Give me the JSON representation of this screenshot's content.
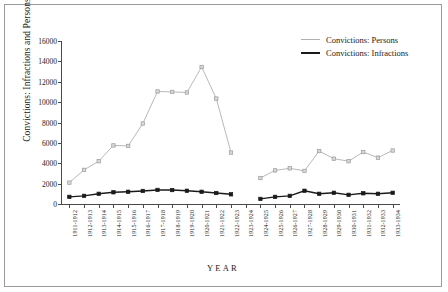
{
  "chart_data": {
    "type": "line",
    "title": "",
    "xlabel": "YEAR",
    "ylabel": "Convictions: Infractions and Persons",
    "ylim": [
      0,
      16000
    ],
    "yticks": [
      0,
      2000,
      4000,
      6000,
      8000,
      10000,
      12000,
      14000,
      16000
    ],
    "grid": false,
    "legend_position": "top-right",
    "categories": [
      "1911-1912",
      "1912-1913",
      "1913-1914",
      "1914-1915",
      "1915-1916",
      "1916-1917",
      "1917-1918",
      "1918-1919",
      "1919-1920",
      "1920-1921",
      "1921-1922",
      "1922-1923",
      "1923-1924",
      "1924-1925",
      "1925-1926",
      "1926-1927",
      "1927-1928",
      "1928-1929",
      "1929-1930",
      "1930-1931",
      "1931-1932",
      "1932-1933",
      "1933-1934"
    ],
    "series": [
      {
        "name": "Convictions: Persons",
        "color": "#b0b0b0",
        "values": [
          2100,
          3350,
          4200,
          5750,
          5700,
          7900,
          11050,
          11000,
          10950,
          13450,
          10350,
          5050,
          null,
          2550,
          3300,
          3500,
          3250,
          5200,
          4450,
          4200,
          5100,
          4550,
          5250
        ]
      },
      {
        "name": "Convictions: Infractions",
        "color": "#1a1a1a",
        "values": [
          700,
          800,
          1000,
          1150,
          1200,
          1280,
          1380,
          1370,
          1300,
          1200,
          1080,
          950,
          null,
          500,
          700,
          800,
          1300,
          1000,
          1100,
          900,
          1050,
          1000,
          1100
        ]
      }
    ]
  },
  "legend": {
    "items": [
      {
        "label": "Convictions: Persons"
      },
      {
        "label": "Convictions: Infractions"
      }
    ]
  }
}
